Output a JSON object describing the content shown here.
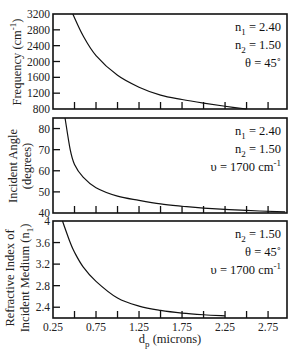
{
  "chart_data": [
    {
      "type": "line",
      "panel": "top",
      "ylabel": "Frequency (cm⁻¹)",
      "ylim": [
        800,
        3200
      ],
      "yticks": [
        800,
        1200,
        1600,
        2000,
        2400,
        2800,
        3200
      ],
      "xlim": [
        0.25,
        2.97
      ],
      "annotations": [
        "n₁ = 2.40",
        "n₂ = 1.50",
        "θ = 45°"
      ],
      "series": [
        {
          "name": "frequency",
          "x": [
            0.48,
            0.6,
            0.75,
            1.0,
            1.25,
            1.5,
            1.75,
            2.0,
            2.25,
            2.5
          ],
          "values": [
            3200,
            2650,
            2150,
            1650,
            1350,
            1150,
            1040,
            950,
            870,
            800
          ]
        }
      ]
    },
    {
      "type": "line",
      "panel": "middle",
      "ylabel": "Incident Angle (degrees)",
      "ylim": [
        40,
        85
      ],
      "yticks": [
        40,
        50,
        60,
        70,
        80
      ],
      "xlim": [
        0.25,
        2.97
      ],
      "annotations": [
        "n₁ = 2.40",
        "n₂ = 1.50",
        "υ = 1700 cm⁻¹"
      ],
      "series": [
        {
          "name": "incident angle",
          "x": [
            0.39,
            0.45,
            0.5,
            0.6,
            0.75,
            1.0,
            1.25,
            1.5,
            1.75,
            2.0,
            2.5,
            2.95
          ],
          "values": [
            85,
            70,
            63,
            57,
            52,
            48,
            46,
            44.3,
            43.2,
            42.3,
            41.2,
            40.5
          ]
        }
      ]
    },
    {
      "type": "line",
      "panel": "bottom",
      "ylabel": "Refractive Index of Incident Medium (n₁)",
      "ylim": [
        2.2,
        4.0
      ],
      "yticks": [
        2.4,
        2.8,
        3.2,
        3.6,
        4
      ],
      "ytick_labels": [
        "2.4",
        "2.8",
        "3.2",
        "3.6",
        "4"
      ],
      "xlabel": "dₚ (microns)",
      "xlim": [
        0.25,
        2.97
      ],
      "xticks": [
        0.25,
        0.5,
        0.75,
        1.0,
        1.25,
        1.5,
        1.75,
        2.0,
        2.25,
        2.5,
        2.75
      ],
      "xtick_labels": [
        "0.25",
        "0.75",
        "1.25",
        "1.75",
        "2.25",
        "2.75"
      ],
      "annotations": [
        "n₂ = 1.50",
        "θ = 45°",
        "υ = 1700 cm⁻¹"
      ],
      "series": [
        {
          "name": "n1",
          "x": [
            0.36,
            0.45,
            0.5,
            0.6,
            0.75,
            1.0,
            1.25,
            1.5,
            1.75,
            2.0,
            2.25
          ],
          "values": [
            4.0,
            3.6,
            3.42,
            3.15,
            2.88,
            2.57,
            2.42,
            2.34,
            2.29,
            2.26,
            2.24
          ]
        }
      ]
    }
  ],
  "labels": {
    "p1_ylabel": "Frequency (cm",
    "p1_ylabel_sup": "-1",
    "p1_ylabel_close": ")",
    "p2_ylabel_1": "Incident  Angle",
    "p2_ylabel_2": "(degrees)",
    "p3_ylabel_1": "Refractive Index of",
    "p3_ylabel_2": "Incident Medium (n",
    "p3_ylabel_sub": "1",
    "p3_ylabel_close": ")",
    "xlabel_main": "d",
    "xlabel_sub": "p",
    "xlabel_rest": " (microns)",
    "p1_ann": [
      {
        "sym": "n",
        "sub": "1",
        "val": " = 2.40"
      },
      {
        "sym": "n",
        "sub": "2",
        "val": " = 1.50"
      },
      {
        "txt": "θ = 45˚"
      }
    ],
    "p2_ann": [
      {
        "sym": "n",
        "sub": "1",
        "val": " = 2.40"
      },
      {
        "sym": "n",
        "sub": "2",
        "val": " = 1.50"
      },
      {
        "txt": "υ = 1700 cm",
        "sup": "-1"
      }
    ],
    "p3_ann": [
      {
        "sym": "n",
        "sub": "2",
        "val": " = 1.50"
      },
      {
        "txt": "θ = 45˚"
      },
      {
        "txt": "υ = 1700 cm",
        "sup": "-1"
      }
    ]
  }
}
